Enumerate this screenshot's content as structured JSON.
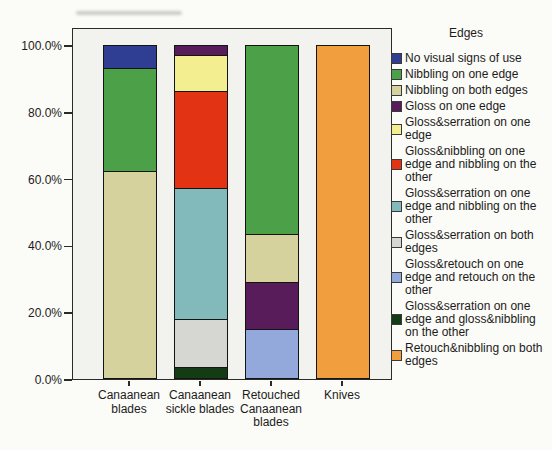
{
  "chart_data": {
    "type": "bar",
    "subtype": "stacked-percent",
    "title": "",
    "legend_title": "Edges",
    "legend_position": "right",
    "grid": false,
    "ylim": [
      0,
      100
    ],
    "yticks": [
      "0.0%",
      "20.0%",
      "40.0%",
      "60.0%",
      "80.0%",
      "100.0%"
    ],
    "categories": [
      "Canaanean blades",
      "Canaanean sickle blades",
      "Retouched Canaanean blades",
      "Knives"
    ],
    "series": [
      {
        "name": "No visual signs of use",
        "color": "#2f3e92",
        "values": [
          7,
          0,
          0,
          0
        ]
      },
      {
        "name": "Nibbling on one edge",
        "color": "#4ba048",
        "values": [
          31,
          0,
          57,
          0
        ]
      },
      {
        "name": "Nibbling on both edges",
        "color": "#d6d29d",
        "values": [
          62,
          0,
          14.5,
          0
        ]
      },
      {
        "name": "Gloss on one edge",
        "color": "#581c5a",
        "values": [
          0,
          3,
          14,
          0
        ]
      },
      {
        "name": "Gloss&serration on one edge",
        "color": "#f3ef90",
        "values": [
          0,
          11,
          0,
          0
        ]
      },
      {
        "name": "Gloss&nibbling on one edge and nibbling on the other",
        "color": "#e23314",
        "values": [
          0,
          29,
          0,
          0
        ]
      },
      {
        "name": "Gloss&serration on one edge and nibbling on the other",
        "color": "#82b9ba",
        "values": [
          0,
          39.5,
          0,
          0
        ]
      },
      {
        "name": "Gloss&serration on both edges",
        "color": "#d6d6d3",
        "values": [
          0,
          14.5,
          0,
          0
        ]
      },
      {
        "name": "Gloss&retouch on one edge and retouch on the other",
        "color": "#93a9db",
        "values": [
          0,
          0,
          14.5,
          0
        ]
      },
      {
        "name": "Gloss&serration on one edge and gloss&nibbling on the other",
        "color": "#143c14",
        "values": [
          0,
          3,
          0,
          0
        ]
      },
      {
        "name": "Retouch&nibbling on both edges",
        "color": "#f09e3e",
        "values": [
          0,
          0,
          0,
          100
        ]
      }
    ]
  }
}
